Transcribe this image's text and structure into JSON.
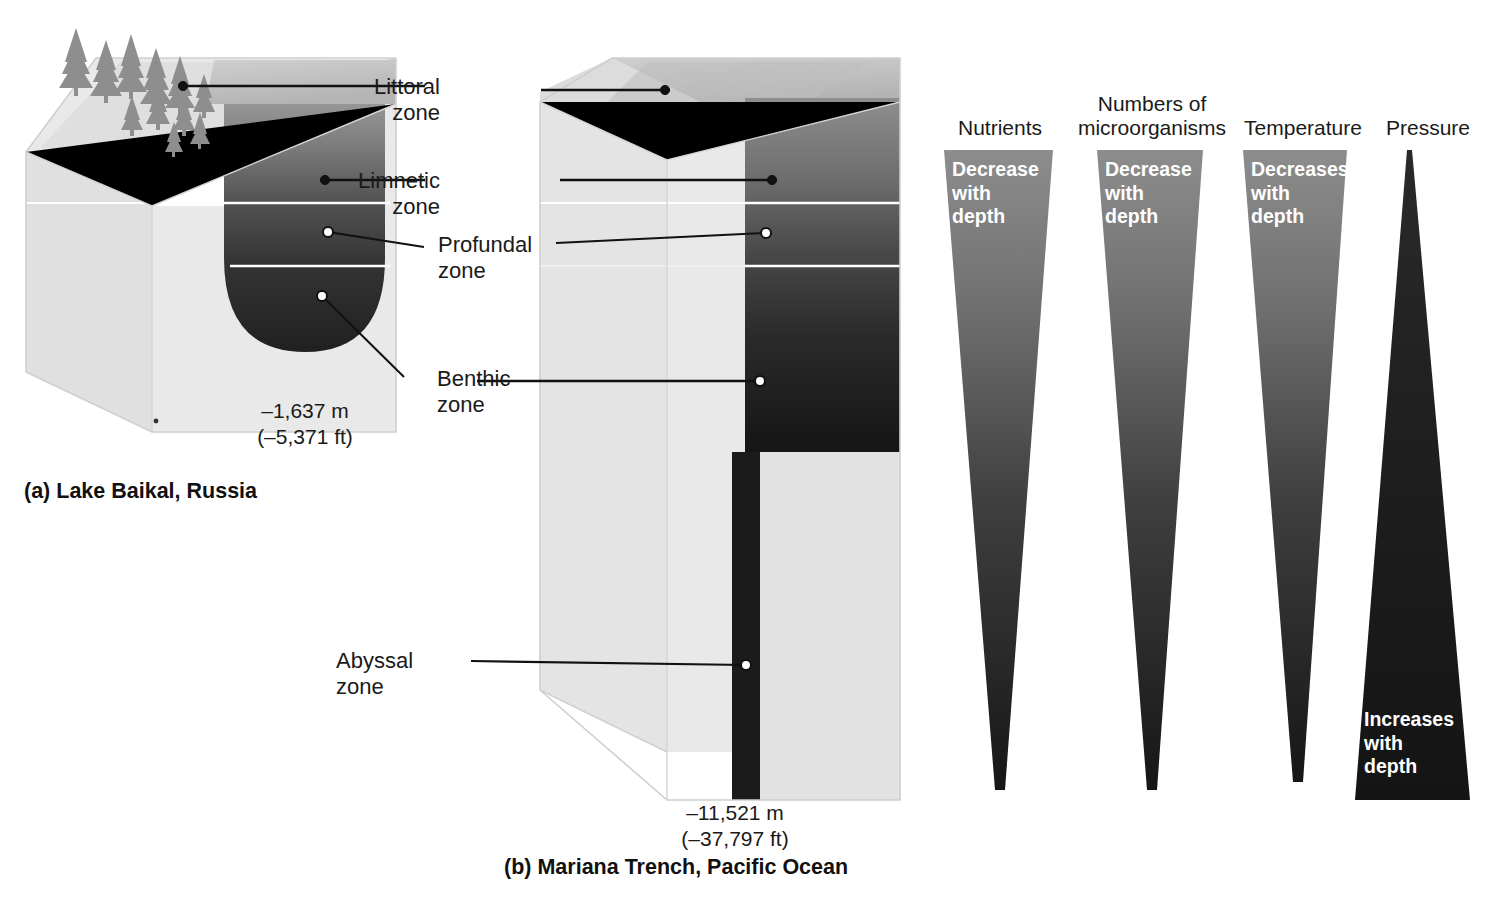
{
  "figure": {
    "zone_labels": [
      {
        "id": "littoral",
        "text": "Littoral\nzone"
      },
      {
        "id": "limnetic",
        "text": "Limnetic\nzone"
      },
      {
        "id": "profundal",
        "text": "Profundal\nzone"
      },
      {
        "id": "benthic",
        "text": "Benthic\nzone"
      },
      {
        "id": "abyssal",
        "text": "Abyssal\nzone"
      }
    ],
    "littoral_line1": "Littoral",
    "littoral_line2": "zone",
    "limnetic_line1": "Limnetic",
    "limnetic_line2": "zone",
    "profundal_line1": "Profundal",
    "profundal_line2": "zone",
    "benthic_line1": "Benthic",
    "benthic_line2": "zone",
    "abyssal_line1": "Abyssal",
    "abyssal_line2": "zone"
  },
  "panel_a": {
    "caption": "(a) Lake Baikal, Russia",
    "depth_m": "–1,637 m",
    "depth_ft": "(–5,371 ft)"
  },
  "panel_b": {
    "caption": "(b) Mariana Trench, Pacific Ocean",
    "depth_m": "–11,521 m",
    "depth_ft": "(–37,797 ft)"
  },
  "gradients": {
    "columns": [
      {
        "id": "nutrients",
        "header_line1": "Nutrients",
        "header_line2": "",
        "trend_line1": "Decrease",
        "trend_line2": "with",
        "trend_line3": "depth",
        "direction": "decreasing",
        "text_position": "top"
      },
      {
        "id": "microorganisms",
        "header_line1": "Numbers of",
        "header_line2": "microorganisms",
        "trend_line1": "Decrease",
        "trend_line2": "with",
        "trend_line3": "depth",
        "direction": "decreasing",
        "text_position": "top"
      },
      {
        "id": "temperature",
        "header_line1": "Temperature",
        "header_line2": "",
        "trend_line1": "Decreases",
        "trend_line2": "with",
        "trend_line3": "depth",
        "direction": "decreasing",
        "text_position": "top"
      },
      {
        "id": "pressure",
        "header_line1": "Pressure",
        "header_line2": "",
        "trend_line1": "Increases",
        "trend_line2": "with",
        "trend_line3": "depth",
        "direction": "increasing",
        "text_position": "bottom"
      }
    ]
  },
  "colors": {
    "block_light": "#e6e6e6",
    "block_top": "#c9c9c9",
    "block_side": "#dcdcdc",
    "water_shallow": "#8f8f8f",
    "water_mid": "#5a5a5a",
    "water_deep": "#2b2b2b",
    "water_abyss": "#1b1b1b",
    "tree": "#8a8a8a",
    "leader": "#111111",
    "text": "#1a1a1a",
    "trend_text": "#ffffff"
  }
}
